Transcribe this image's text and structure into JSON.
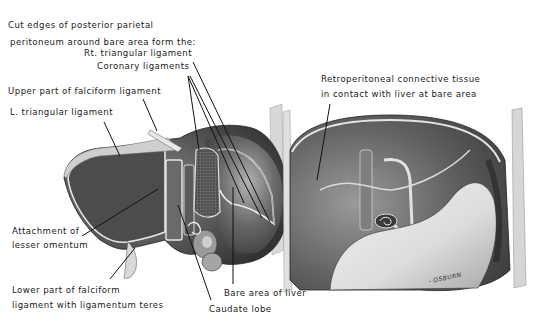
{
  "figure": {
    "type": "anatomical-illustration",
    "panels": [
      "left: liver posterior surface",
      "right: posterior abdominal wall after liver removal"
    ],
    "signature": "- OSBURN"
  },
  "labels": {
    "cut_edges_line1": "Cut edges of posterior parietal",
    "cut_edges_line2": "peritoneum around bare area form the:",
    "rt_triangular": "Rt. triangular ligament",
    "coronary": "Coronary ligaments",
    "upper_falciform": "Upper part of falciform ligament",
    "l_triangular": "L. triangular ligament",
    "lesser_omentum_line1": "Attachment of",
    "lesser_omentum_line2": "lesser omentum",
    "lower_falciform_line1": "Lower part of falciform",
    "lower_falciform_line2": "ligament with ligamentum teres",
    "bare_area": "Bare area of liver",
    "caudate": "Caudate lobe",
    "retro_line1": "Retroperitoneal connective tissue",
    "retro_line2": "in contact with liver at bare area"
  },
  "colors": {
    "background": "#ffffff",
    "text": "#1a1a1a",
    "leader": "#111111",
    "liver_dark": "#4a4a4a",
    "liver_mid": "#7a7a7a",
    "liver_light": "#c9c9c9",
    "peritoneum_edge": "#e8e8e8"
  }
}
